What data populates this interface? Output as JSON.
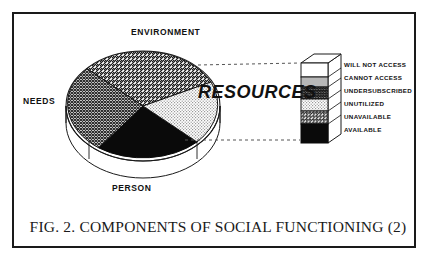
{
  "figure": {
    "caption": "FIG. 2. COMPONENTS OF SOCIAL FUNCTIONING (2)",
    "center_label": "RESOURCES"
  },
  "pie": {
    "labels": {
      "top": "ENVIRONMENT",
      "left": "NEEDS",
      "bottom": "PERSON"
    },
    "sectors": [
      {
        "name": "environment",
        "fill": "diagonal-hatch",
        "label": "ENVIRONMENT"
      },
      {
        "name": "resources",
        "fill": "light-stipple",
        "label": "RESOURCES"
      },
      {
        "name": "person",
        "fill": "solid-black",
        "label": "PERSON"
      },
      {
        "name": "needs",
        "fill": "cross-hatch",
        "label": "NEEDS"
      }
    ]
  },
  "bar": {
    "segments": [
      {
        "label": "WILL NOT ACCESS",
        "fill": "white"
      },
      {
        "label": "CANNOT ACCESS",
        "fill": "mid-gray"
      },
      {
        "label": "UNDERSUBSCRIBED",
        "fill": "dark-cross-hatch"
      },
      {
        "label": "UNUTILIZED",
        "fill": "light-stipple"
      },
      {
        "label": "UNAVAILABLE",
        "fill": "diagonal-hatch"
      },
      {
        "label": "AVAILABLE",
        "fill": "solid-black"
      }
    ]
  },
  "colors": {
    "ink": "#111111",
    "frame": "#1a1a1a",
    "paper": "#ffffff",
    "mid_gray": "#b8b8b8",
    "light_gray": "#e2e2e2"
  }
}
